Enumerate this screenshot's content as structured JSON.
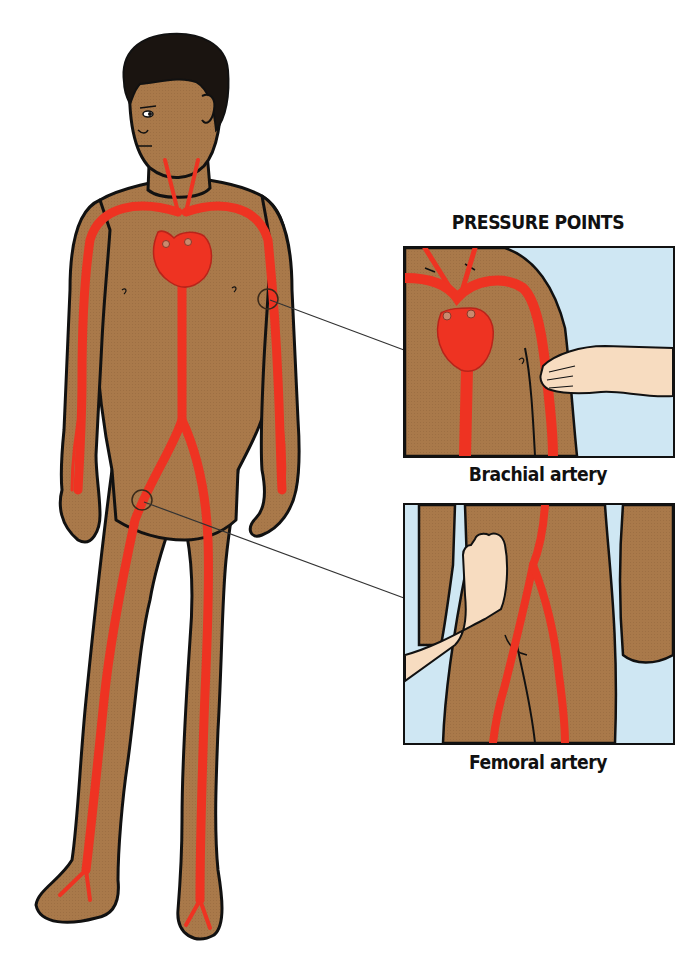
{
  "title": "PRESSURE POINTS",
  "figure": {
    "colors": {
      "skin": "#a9794a",
      "skin_dark": "#8a5e36",
      "hair": "#1a1410",
      "artery": "#ee3322",
      "outline": "#111111",
      "helper_hand": "#f7dcc0",
      "panel_background": "#cfe7f3",
      "page_background": "#ffffff"
    },
    "markers": [
      {
        "id": "brachial",
        "label": "Brachial artery"
      },
      {
        "id": "femoral",
        "label": "Femoral artery"
      }
    ]
  },
  "panels": [
    {
      "id": "brachial",
      "caption": "Brachial artery"
    },
    {
      "id": "femoral",
      "caption": "Femoral artery"
    }
  ]
}
